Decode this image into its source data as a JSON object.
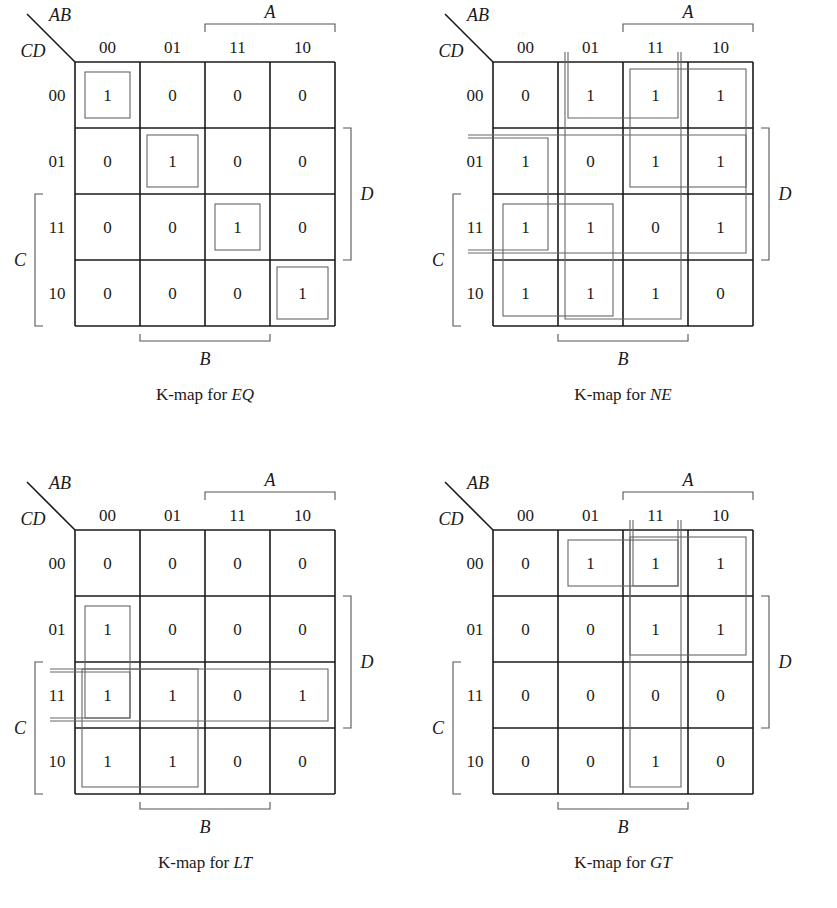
{
  "axis": {
    "col_var": "AB",
    "row_var": "CD",
    "col_codes": [
      "00",
      "01",
      "11",
      "10"
    ],
    "row_codes": [
      "00",
      "01",
      "11",
      "10"
    ],
    "bracket_labels": {
      "top": "A",
      "right": "D",
      "left": "C",
      "bottom": "B"
    }
  },
  "caption_prefix": "K-map for ",
  "kmaps": [
    {
      "name": "EQ",
      "caption_var": "EQ",
      "cells": [
        [
          "1",
          "0",
          "0",
          "0"
        ],
        [
          "0",
          "1",
          "0",
          "0"
        ],
        [
          "0",
          "0",
          "1",
          "0"
        ],
        [
          "0",
          "0",
          "0",
          "1"
        ]
      ],
      "groups": [
        {
          "r0": 0,
          "c0": 0,
          "r1": 0,
          "c1": 0
        },
        {
          "r0": 1,
          "c0": 1,
          "r1": 1,
          "c1": 1
        },
        {
          "r0": 2,
          "c0": 2,
          "r1": 2,
          "c1": 2
        },
        {
          "r0": 3,
          "c0": 3,
          "r1": 3,
          "c1": 3
        }
      ]
    },
    {
      "name": "NE",
      "caption_var": "NE",
      "cells": [
        [
          "0",
          "1",
          "1",
          "1"
        ],
        [
          "1",
          "0",
          "1",
          "1"
        ],
        [
          "1",
          "1",
          "0",
          "1"
        ],
        [
          "1",
          "1",
          "1",
          "0"
        ]
      ],
      "groups": [
        {
          "r0": 0,
          "c0": 1,
          "r1": 0,
          "c1": 2,
          "wrap": "v"
        },
        {
          "r0": 0,
          "c0": 2,
          "r1": 1,
          "c1": 3
        },
        {
          "r0": 1,
          "c0": 0,
          "r1": 2,
          "c1": 0,
          "wrap": "h"
        },
        {
          "r0": 1,
          "c0": 3,
          "r1": 2,
          "c1": 3,
          "wrap": "h"
        },
        {
          "r0": 2,
          "c0": 0,
          "r1": 3,
          "c1": 1
        },
        {
          "r0": 3,
          "c0": 1,
          "r1": 3,
          "c1": 2,
          "wrap": "v"
        }
      ]
    },
    {
      "name": "LT",
      "caption_var": "LT",
      "cells": [
        [
          "0",
          "0",
          "0",
          "0"
        ],
        [
          "1",
          "0",
          "0",
          "0"
        ],
        [
          "1",
          "1",
          "0",
          "1"
        ],
        [
          "1",
          "1",
          "0",
          "0"
        ]
      ],
      "groups": [
        {
          "r0": 1,
          "c0": 0,
          "r1": 2,
          "c1": 0
        },
        {
          "r0": 2,
          "c0": 0,
          "r1": 3,
          "c1": 1
        },
        {
          "r0": 2,
          "c0": 0,
          "r1": 2,
          "c1": 0,
          "wrap": "h"
        },
        {
          "r0": 2,
          "c0": 3,
          "r1": 2,
          "c1": 3,
          "wrap": "h"
        }
      ]
    },
    {
      "name": "GT",
      "caption_var": "GT",
      "cells": [
        [
          "0",
          "1",
          "1",
          "1"
        ],
        [
          "0",
          "0",
          "1",
          "1"
        ],
        [
          "0",
          "0",
          "0",
          "0"
        ],
        [
          "0",
          "0",
          "1",
          "0"
        ]
      ],
      "groups": [
        {
          "r0": 0,
          "c0": 1,
          "r1": 0,
          "c1": 2
        },
        {
          "r0": 0,
          "c0": 2,
          "r1": 1,
          "c1": 3
        },
        {
          "r0": 0,
          "c0": 2,
          "r1": 0,
          "c1": 2,
          "wrap": "v"
        },
        {
          "r0": 3,
          "c0": 2,
          "r1": 3,
          "c1": 2,
          "wrap": "v"
        }
      ]
    }
  ]
}
